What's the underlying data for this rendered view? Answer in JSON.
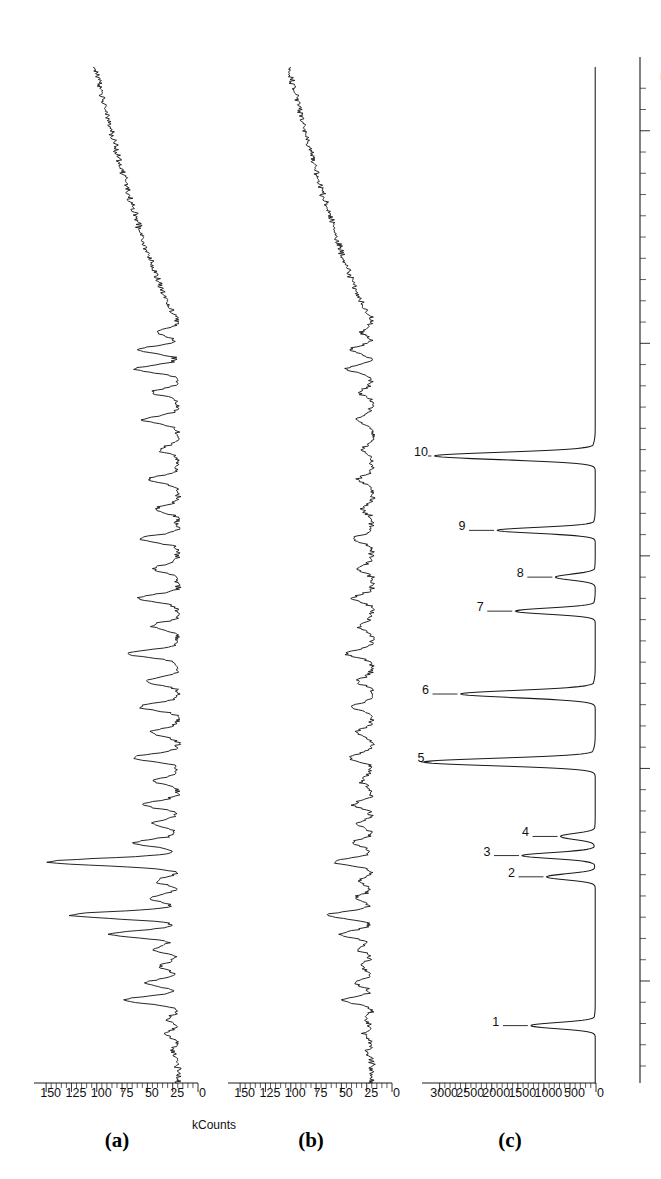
{
  "figure": {
    "kind": "gas-chromatogram-panel-figure",
    "orientation": "rotated-90-ccw",
    "panel_labels": [
      "(a)",
      "(b)",
      "(c)"
    ],
    "shared_x_axis_label": "min",
    "shared_y_axis_label": "kCounts"
  },
  "panels": {
    "a": {
      "label": "(a)"
    },
    "b": {
      "label": "(b)"
    },
    "c": {
      "label": "(c)"
    }
  },
  "axis": {
    "x_label": "min",
    "x_ticks": [
      "10",
      "15",
      "20",
      "25",
      "30"
    ],
    "y_label": "kCounts",
    "y_ticks_a": [
      "0",
      "25",
      "50",
      "75",
      "100",
      "125",
      "150"
    ],
    "y_ticks_b": [
      "0",
      "25",
      "50",
      "75",
      "100",
      "125",
      "150"
    ],
    "y_ticks_c": [
      "0",
      "500",
      "1000",
      "1500",
      "2000",
      "2500",
      "3000"
    ]
  },
  "peak_labels": [
    "1",
    "2",
    "3",
    "4",
    "5",
    "6",
    "7",
    "8",
    "9",
    "10"
  ],
  "colors": {
    "trace": "#1a1a1a",
    "axis": "#1a1a1a",
    "background": "#ffffff"
  },
  "chart_data": {
    "type": "line",
    "title": "",
    "xlabel": "min",
    "ylabel": "kCounts",
    "xlim": [
      7.6,
      31.5
    ],
    "grid": false,
    "legend": "none",
    "panels": [
      {
        "id": "a",
        "label": "(a)",
        "ylabel": "kCounts",
        "ylim": [
          0,
          160
        ],
        "yticks": [
          0,
          25,
          50,
          75,
          100,
          125,
          150
        ],
        "description": "Noisy chromatogram with many small-to-medium peaks over a ~20 kCounts baseline; tallest peaks near 11.5 and 12.8 min; rising baseline after 25 min.",
        "baseline": 20,
        "peaks": [
          {
            "t": 8.35,
            "h": 26
          },
          {
            "t": 8.75,
            "h": 31
          },
          {
            "t": 9.1,
            "h": 30
          },
          {
            "t": 9.55,
            "h": 74
          },
          {
            "t": 9.95,
            "h": 51
          },
          {
            "t": 10.35,
            "h": 38
          },
          {
            "t": 10.75,
            "h": 43
          },
          {
            "t": 11.1,
            "h": 86
          },
          {
            "t": 11.55,
            "h": 126
          },
          {
            "t": 11.95,
            "h": 48
          },
          {
            "t": 12.35,
            "h": 40
          },
          {
            "t": 12.8,
            "h": 148
          },
          {
            "t": 13.25,
            "h": 62
          },
          {
            "t": 13.7,
            "h": 45
          },
          {
            "t": 14.15,
            "h": 55
          },
          {
            "t": 14.7,
            "h": 42
          },
          {
            "t": 15.25,
            "h": 64
          },
          {
            "t": 15.85,
            "h": 47
          },
          {
            "t": 16.45,
            "h": 58
          },
          {
            "t": 17.05,
            "h": 52
          },
          {
            "t": 17.7,
            "h": 70
          },
          {
            "t": 18.35,
            "h": 46
          },
          {
            "t": 19.0,
            "h": 60
          },
          {
            "t": 19.7,
            "h": 44
          },
          {
            "t": 20.4,
            "h": 57
          },
          {
            "t": 21.1,
            "h": 41
          },
          {
            "t": 21.8,
            "h": 49
          },
          {
            "t": 22.5,
            "h": 38
          },
          {
            "t": 23.2,
            "h": 54
          },
          {
            "t": 23.85,
            "h": 44
          },
          {
            "t": 24.4,
            "h": 62
          },
          {
            "t": 24.85,
            "h": 58
          },
          {
            "t": 25.25,
            "h": 40
          }
        ]
      },
      {
        "id": "b",
        "label": "(b)",
        "ylabel": "kCounts",
        "ylim": [
          0,
          160
        ],
        "yticks": [
          0,
          25,
          50,
          75,
          100,
          125,
          150
        ],
        "description": "Noisy chromatogram similar in profile to (a) but with substantially lower peak intensities; baseline ~20 kCounts, rising after 25 min.",
        "baseline": 20,
        "peaks": [
          {
            "t": 8.35,
            "h": 24
          },
          {
            "t": 8.75,
            "h": 27
          },
          {
            "t": 9.1,
            "h": 26
          },
          {
            "t": 9.55,
            "h": 48
          },
          {
            "t": 9.95,
            "h": 35
          },
          {
            "t": 10.35,
            "h": 30
          },
          {
            "t": 10.75,
            "h": 33
          },
          {
            "t": 11.1,
            "h": 52
          },
          {
            "t": 11.55,
            "h": 64
          },
          {
            "t": 11.95,
            "h": 36
          },
          {
            "t": 12.35,
            "h": 32
          },
          {
            "t": 12.8,
            "h": 58
          },
          {
            "t": 13.25,
            "h": 40
          },
          {
            "t": 13.7,
            "h": 33
          },
          {
            "t": 14.15,
            "h": 38
          },
          {
            "t": 14.7,
            "h": 31
          },
          {
            "t": 15.25,
            "h": 42
          },
          {
            "t": 15.85,
            "h": 34
          },
          {
            "t": 16.45,
            "h": 39
          },
          {
            "t": 17.05,
            "h": 35
          },
          {
            "t": 17.7,
            "h": 45
          },
          {
            "t": 18.35,
            "h": 33
          },
          {
            "t": 19.0,
            "h": 40
          },
          {
            "t": 19.7,
            "h": 32
          },
          {
            "t": 20.4,
            "h": 38
          },
          {
            "t": 21.1,
            "h": 30
          },
          {
            "t": 21.8,
            "h": 34
          },
          {
            "t": 22.5,
            "h": 29
          },
          {
            "t": 23.2,
            "h": 36
          },
          {
            "t": 23.85,
            "h": 32
          },
          {
            "t": 24.4,
            "h": 44
          },
          {
            "t": 24.85,
            "h": 41
          },
          {
            "t": 25.25,
            "h": 30
          }
        ]
      },
      {
        "id": "c",
        "label": "(c)",
        "ylabel": "kCounts",
        "ylim": [
          0,
          3300
        ],
        "yticks": [
          0,
          500,
          1000,
          1500,
          2000,
          2500,
          3000
        ],
        "description": "Standard mixture with ten sharp, labelled peaks. Peak 5 is off-scale tall (>3300), peaks 6 and 10 are very large; baseline flat near 0.",
        "baseline": 15,
        "peaks": [
          {
            "n": "1",
            "t": 8.95,
            "h": 1250
          },
          {
            "n": "2",
            "t": 12.45,
            "h": 950
          },
          {
            "n": "3",
            "t": 12.95,
            "h": 1420
          },
          {
            "n": "4",
            "t": 13.4,
            "h": 680
          },
          {
            "n": "5",
            "t": 15.15,
            "h": 3300
          },
          {
            "n": "6",
            "t": 16.75,
            "h": 2600
          },
          {
            "n": "7",
            "t": 18.7,
            "h": 1550
          },
          {
            "n": "8",
            "t": 19.5,
            "h": 780
          },
          {
            "n": "9",
            "t": 20.6,
            "h": 1900
          },
          {
            "n": "10",
            "t": 22.35,
            "h": 3100
          }
        ]
      }
    ]
  }
}
